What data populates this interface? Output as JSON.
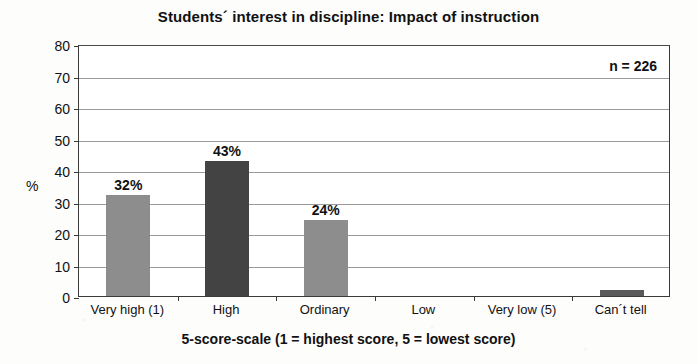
{
  "chart_data": {
    "type": "bar",
    "title": "Students´ interest in discipline: Impact of instruction",
    "xlabel": "5-score-scale (1 = highest score, 5 = lowest score)",
    "ylabel": "%",
    "ylim": [
      0,
      80
    ],
    "ytick_step": 10,
    "yticks": [
      "80",
      "70",
      "60",
      "50",
      "40",
      "30",
      "20",
      "10",
      "0"
    ],
    "grid": true,
    "legend": "none",
    "annotation": "n = 226",
    "categories": [
      "Very high (1)",
      "High",
      "Ordinary",
      "Low",
      "Very low (5)",
      "Can´t tell"
    ],
    "values": [
      32,
      43,
      24,
      0,
      0,
      2
    ],
    "data_labels": [
      "32%",
      "43%",
      "24%",
      "",
      "",
      ""
    ],
    "bar_colors": [
      "#8d8d8d",
      "#434343",
      "#8d8d8d",
      "#8d8d8d",
      "#8d8d8d",
      "#5a5a5a"
    ]
  },
  "colors": {
    "bar_light": "#8d8d8d",
    "bar_dark": "#434343",
    "axis": "#3a3a3a",
    "gridline": "#9a9a9a",
    "text": "#111111",
    "page_background": "#fdfdfc",
    "plot_background": "#ffffff"
  }
}
